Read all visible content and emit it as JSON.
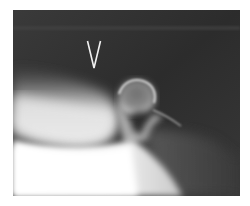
{
  "image": {
    "kind": "radiograph",
    "description": "Grayscale X-ray of a rounded bony condyle-like structure with surrounding soft tissue",
    "marker_label": "V",
    "colors": {
      "background_dark": "#2e2e2e",
      "bone_bright": "#f4f4f4",
      "soft_tissue": "#9a9a9a",
      "page": "#ffffff"
    }
  }
}
